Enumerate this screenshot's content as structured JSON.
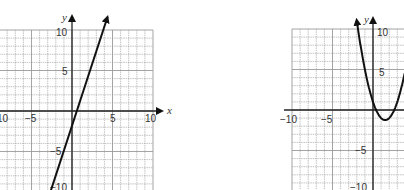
{
  "chart_data": [
    {
      "type": "line",
      "title": "",
      "xlabel": "x",
      "ylabel": "y",
      "xlim": [
        -10,
        10
      ],
      "ylim": [
        -10,
        10
      ],
      "grid": true,
      "x_ticks": [
        "-10",
        "-5",
        "5",
        "10"
      ],
      "y_ticks": [
        "10",
        "5",
        "-5",
        "-10"
      ],
      "series": [
        {
          "name": "line",
          "equation": "y = 3x - 2",
          "x": [
            -2.67,
            4.5
          ],
          "y": [
            -10,
            11.5
          ]
        }
      ]
    },
    {
      "type": "line",
      "title": "",
      "xlabel": "x",
      "ylabel": "y",
      "xlim": [
        -10,
        10
      ],
      "ylim": [
        -10,
        10
      ],
      "grid": true,
      "x_ticks": [
        "-10",
        "-5"
      ],
      "y_ticks": [
        "10",
        "5",
        "-5",
        "-10"
      ],
      "series": [
        {
          "name": "parabola",
          "equation": "y = x^2 - 3x + 1",
          "vertex": [
            1.5,
            -1.25
          ],
          "x": [
            -1.9,
            -1,
            0,
            1,
            1.5,
            2,
            3,
            4
          ],
          "y": [
            10.3,
            5,
            1,
            -1,
            -1.25,
            -1,
            1,
            5
          ]
        }
      ]
    }
  ],
  "left": {
    "xlabel": "x",
    "ylabel": "y",
    "ticks": {
      "xneg10": "10",
      "xneg5": "−5",
      "x5": "5",
      "x10": "10",
      "y10": "10",
      "y5": "5",
      "yneg5": "−5",
      "yneg10": "−10"
    }
  },
  "right": {
    "ylabel": "y",
    "ticks": {
      "xneg10": "−10",
      "xneg5": "−5",
      "y10": "10",
      "y5": "5",
      "yneg5": "−5",
      "yneg10": "−10"
    }
  },
  "colors": {
    "grid": "#9a9a9a",
    "axis": "#222222",
    "curve": "#111111"
  }
}
